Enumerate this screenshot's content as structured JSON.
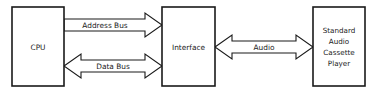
{
  "diagram": {
    "background_color": "#ffffff",
    "line_color": "#1a1a1a",
    "nodes": [
      {
        "id": "cpu",
        "label": "CPU",
        "lines": [
          "CPU"
        ],
        "shape": "rectangle",
        "x": 12,
        "y": 7,
        "width": 52,
        "height": 79
      },
      {
        "id": "interface",
        "label": "Interface",
        "lines": [
          "Interface"
        ],
        "shape": "rectangle",
        "x": 162,
        "y": 7,
        "width": 53,
        "height": 79
      },
      {
        "id": "cassette",
        "label": "Standard Audio Cassette Player",
        "lines": [
          "Standard",
          "Audio",
          "Cassette",
          "Player"
        ],
        "shape": "rectangle",
        "x": 313,
        "y": 7,
        "width": 52,
        "height": 79
      }
    ],
    "edges": [
      {
        "id": "address-bus",
        "label": "Address Bus",
        "from": "cpu",
        "to": "interface",
        "direction": "unidirectional",
        "arrowheads": [
          "right"
        ],
        "x1": 64,
        "x2": 162,
        "cy": 25,
        "half_thickness": 6,
        "head_length": 17,
        "head_half": 12
      },
      {
        "id": "data-bus",
        "label": "Data Bus",
        "from": "cpu",
        "to": "interface",
        "direction": "bidirectional",
        "arrowheads": [
          "left",
          "right"
        ],
        "x1": 64,
        "x2": 162,
        "cy": 66,
        "half_thickness": 6,
        "head_length": 17,
        "head_half": 12
      },
      {
        "id": "audio",
        "label": "Audio",
        "from": "interface",
        "to": "cassette",
        "direction": "bidirectional",
        "arrowheads": [
          "left",
          "right"
        ],
        "x1": 215,
        "x2": 313,
        "cy": 47,
        "half_thickness": 6,
        "head_length": 17,
        "head_half": 12
      }
    ]
  }
}
